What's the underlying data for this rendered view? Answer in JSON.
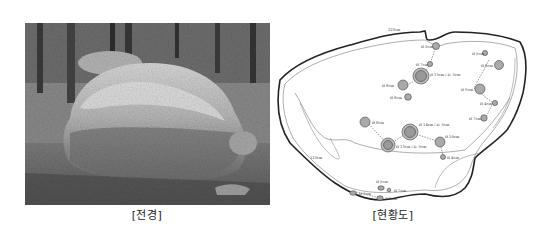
{
  "figures": {
    "photo": {
      "caption": "[전경]",
      "description": "Grayscale photo of a large boulder in a forest"
    },
    "diagram": {
      "caption": "[현황도]",
      "dimension_labels": {
        "top_width": "223cm",
        "left_height": "113cm"
      },
      "cupmarks": [
        {
          "label": "Ø 5cm"
        },
        {
          "label": "Ø 7cm"
        },
        {
          "label": "Ø 15cm / D. 5cm"
        },
        {
          "label": "Ø 8cm"
        },
        {
          "label": "Ø 8cm"
        },
        {
          "label": "Ø 5cm"
        },
        {
          "label": "Ø 8cm"
        },
        {
          "label": "Ø 9cm"
        },
        {
          "label": "Ø 4cm"
        },
        {
          "label": "Ø 7cm"
        },
        {
          "label": "Ø 8cm"
        },
        {
          "label": "Ø 14cm / D. 5cm"
        },
        {
          "label": "Ø 13cm / D. 5cm"
        },
        {
          "label": "Ø 10cm"
        },
        {
          "label": "Ø 4cm"
        },
        {
          "label": "Ø 5cm"
        },
        {
          "label": "Ø 7cm"
        },
        {
          "label": "Ø 9cm"
        },
        {
          "label": "Ø 5cm"
        }
      ]
    }
  }
}
